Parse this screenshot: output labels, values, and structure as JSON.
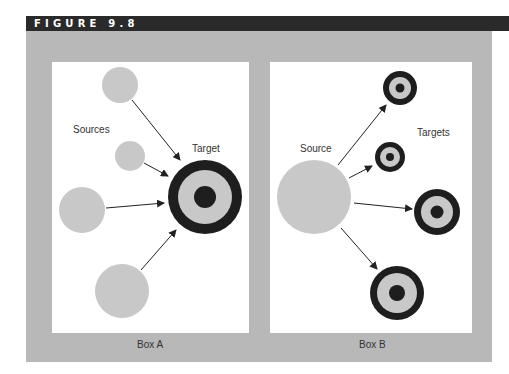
{
  "figure": {
    "title": "FIGURE 9.8",
    "colors": {
      "title_bar": "#2a2a2a",
      "panel": "#b8b8b8",
      "box_bg": "#ffffff",
      "source_circle": "#c8c8c8",
      "target_dark": "#1e1e1e",
      "target_ring": "#c8c8c8",
      "arrow": "#222222"
    }
  },
  "box_a": {
    "caption": "Box A",
    "sources_label": "Sources",
    "target_label": "Target"
  },
  "box_b": {
    "caption": "Box B",
    "source_label": "Source",
    "targets_label": "Targets"
  }
}
